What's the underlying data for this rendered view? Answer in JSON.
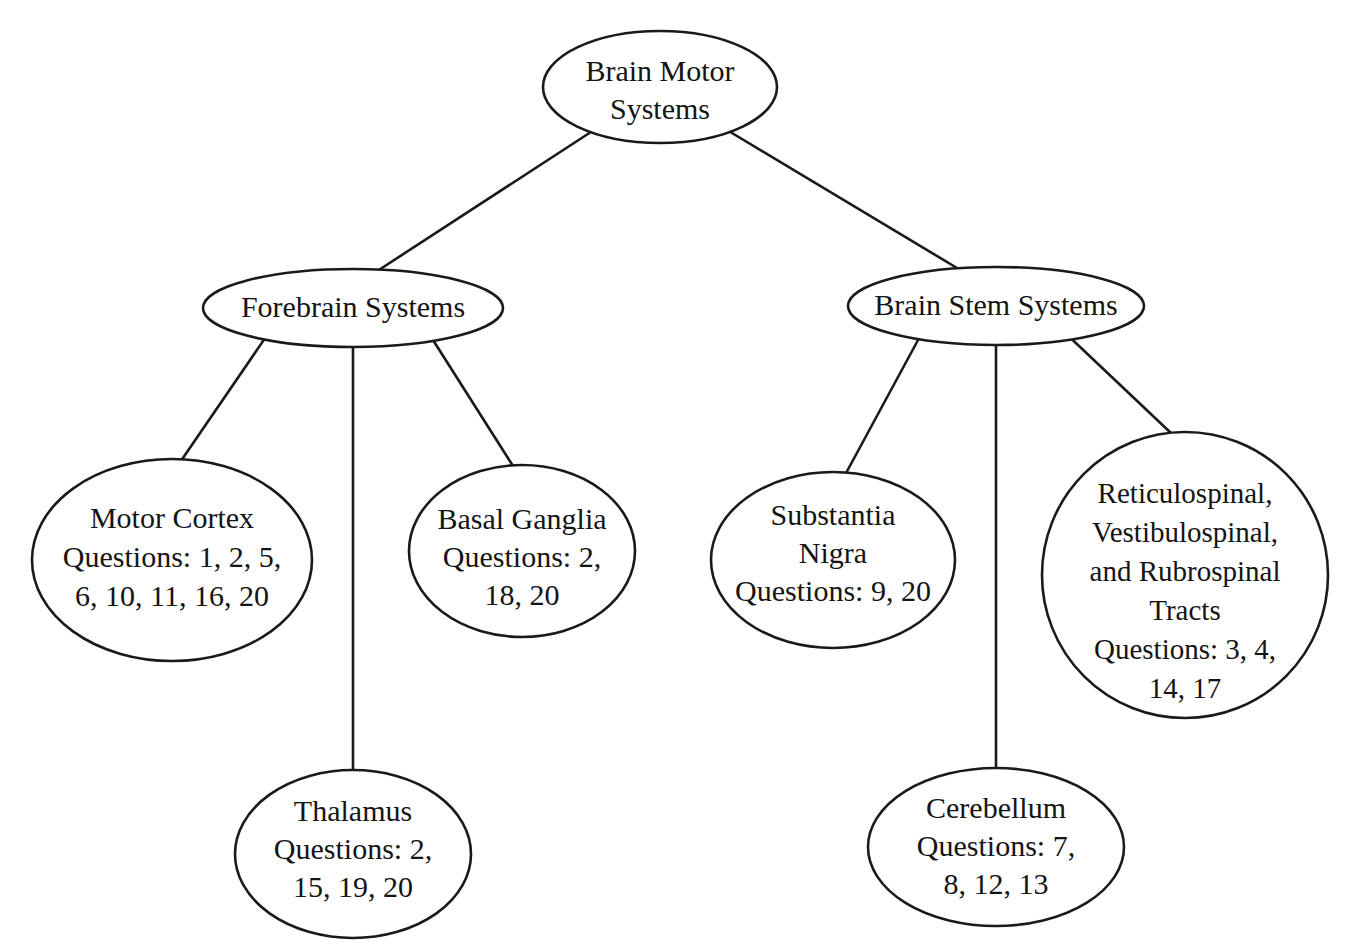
{
  "diagram": {
    "type": "concept-map-tree",
    "title": "Brain Motor Systems",
    "background_color": "#ffffff",
    "stroke_color": "#1a1a1a",
    "text_color": "#141414",
    "nodes": {
      "root": {
        "id": "brain-motor-systems",
        "shape": "ellipse",
        "lines": [
          "Brain Motor",
          "Systems"
        ]
      },
      "forebrain": {
        "id": "forebrain-systems",
        "shape": "ellipse",
        "lines": [
          "Forebrain Systems"
        ]
      },
      "brainstem": {
        "id": "brain-stem-systems",
        "shape": "ellipse",
        "lines": [
          "Brain Stem Systems"
        ]
      },
      "motor_cortex": {
        "id": "motor-cortex",
        "shape": "ellipse",
        "lines": [
          "Motor Cortex",
          "Questions: 1, 2, 5,",
          "6, 10, 11, 16, 20"
        ]
      },
      "basal_ganglia": {
        "id": "basal-ganglia",
        "shape": "ellipse",
        "lines": [
          "Basal Ganglia",
          "Questions: 2,",
          "18, 20"
        ]
      },
      "thalamus": {
        "id": "thalamus",
        "shape": "ellipse",
        "lines": [
          "Thalamus",
          "Questions: 2,",
          "15, 19, 20"
        ]
      },
      "substantia_nigra": {
        "id": "substantia-nigra",
        "shape": "ellipse",
        "lines": [
          "Substantia",
          "Nigra",
          "Questions: 9, 20"
        ]
      },
      "tracts": {
        "id": "reticulospinal-vestibulospinal-rubrospinal-tracts",
        "shape": "circle",
        "lines": [
          "Reticulospinal,",
          "Vestibulospinal,",
          "and Rubrospinal",
          "Tracts",
          "Questions: 3, 4,",
          "14, 17"
        ]
      },
      "cerebellum": {
        "id": "cerebellum",
        "shape": "ellipse",
        "lines": [
          "Cerebellum",
          "Questions: 7,",
          "8, 12, 13"
        ]
      }
    },
    "edges": [
      {
        "from": "brain-motor-systems",
        "to": "forebrain-systems"
      },
      {
        "from": "brain-motor-systems",
        "to": "brain-stem-systems"
      },
      {
        "from": "forebrain-systems",
        "to": "motor-cortex"
      },
      {
        "from": "forebrain-systems",
        "to": "thalamus"
      },
      {
        "from": "forebrain-systems",
        "to": "basal-ganglia"
      },
      {
        "from": "brain-stem-systems",
        "to": "substantia-nigra"
      },
      {
        "from": "brain-stem-systems",
        "to": "cerebellum"
      },
      {
        "from": "brain-stem-systems",
        "to": "reticulospinal-vestibulospinal-rubrospinal-tracts"
      }
    ]
  }
}
